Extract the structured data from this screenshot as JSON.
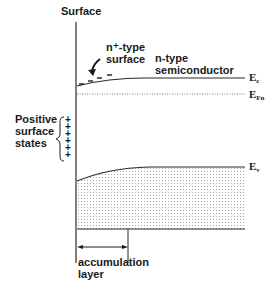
{
  "figure": {
    "type": "energy-band-diagram",
    "labels": {
      "surface": "Surface",
      "n_plus_line1": "n⁺-type",
      "n_plus_line2": "surface",
      "n_type_line1": "n-type",
      "n_type_line2": "semiconductor",
      "positive_line1": "Positive",
      "positive_line2": "surface",
      "positive_line3": "states",
      "accumulation_line1": "accumulation",
      "accumulation_line2": "layer"
    },
    "bands": {
      "conduction": {
        "symbol": "E",
        "sub": "c"
      },
      "fermi": {
        "symbol": "E",
        "sub": "Fn"
      },
      "valence": {
        "symbol": "E",
        "sub": "v"
      }
    },
    "surface_charges": {
      "electrons": [
        "−",
        "−",
        "−",
        "−"
      ],
      "positive_states": [
        "+",
        "+",
        "+",
        "+",
        "+",
        "+"
      ]
    },
    "colors": {
      "line": "#2a2a2a",
      "dots": "#9a9a9a"
    }
  }
}
